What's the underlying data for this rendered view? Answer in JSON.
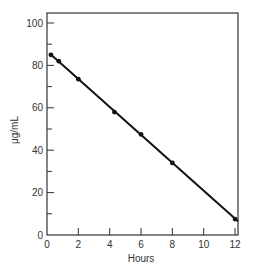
{
  "chart_data": {
    "type": "line",
    "title": "",
    "xlabel": "Hours",
    "ylabel": "μg/mL",
    "xlim": [
      0,
      12.2
    ],
    "ylim": [
      0,
      105
    ],
    "x_ticks": [
      0,
      2,
      4,
      6,
      8,
      10,
      12
    ],
    "x_tick_labels": [
      "0",
      "2",
      "4",
      "6",
      "8",
      "10",
      "12"
    ],
    "y_ticks": [
      0,
      20,
      40,
      60,
      80,
      100
    ],
    "y_tick_labels": [
      "0",
      "20",
      "40",
      "60",
      "80",
      "100"
    ],
    "y_minor_ticks": [
      10,
      30,
      50,
      70,
      90
    ],
    "grid": false,
    "legend": null,
    "series": [
      {
        "name": "Concentration",
        "x": [
          0.25,
          0.75,
          2,
          4.3,
          6,
          8,
          12
        ],
        "values": [
          85,
          82,
          73.5,
          58,
          47.5,
          34,
          7.5
        ],
        "line_start": [
          0.0,
          85.5
        ],
        "line_end": [
          12.2,
          6.5
        ],
        "color": "#111111"
      }
    ]
  }
}
